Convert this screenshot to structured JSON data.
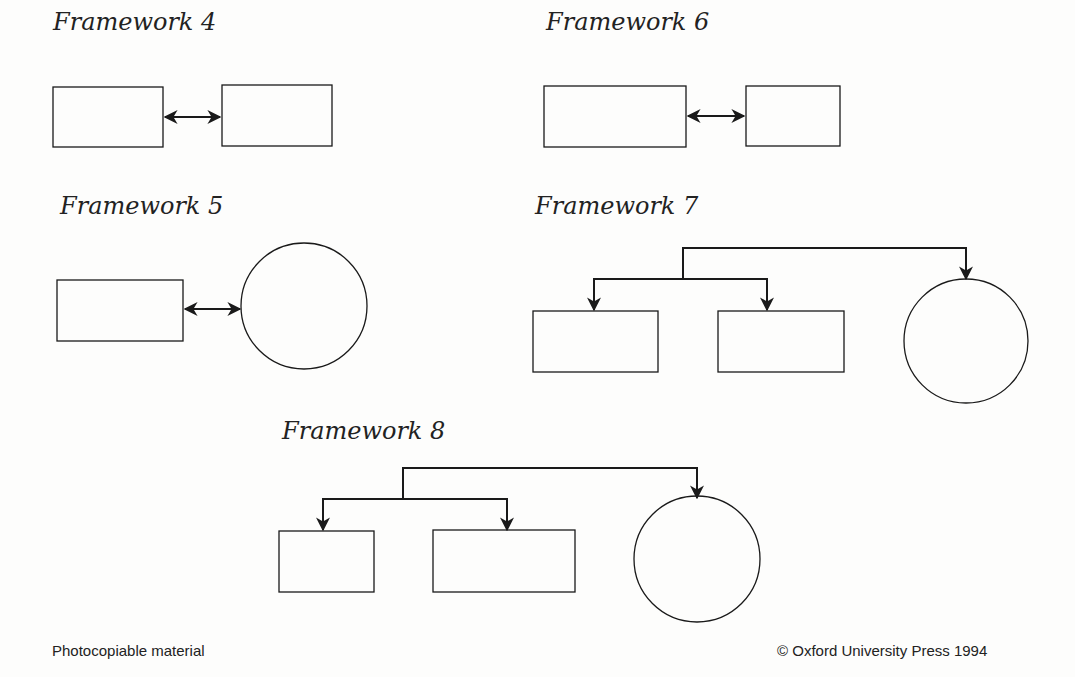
{
  "frameworks": [
    {
      "title": "Framework 4",
      "pos": [
        53,
        8
      ],
      "boxes": [
        [
          53,
          87,
          110,
          60
        ],
        [
          222,
          85,
          110,
          61
        ]
      ],
      "circles": [],
      "links": [
        {
          "type": "double",
          "x1": 165,
          "x2": 220,
          "y": 117
        }
      ]
    },
    {
      "title": "Framework 6",
      "pos": [
        546,
        8
      ],
      "boxes": [
        [
          544,
          86,
          142,
          61
        ],
        [
          746,
          86,
          94,
          60
        ]
      ],
      "circles": [],
      "links": [
        {
          "type": "double",
          "x1": 688,
          "x2": 744,
          "y": 116
        }
      ]
    },
    {
      "title": "Framework 5",
      "pos": [
        60,
        192
      ],
      "boxes": [
        [
          57,
          280,
          126,
          61
        ]
      ],
      "circles": [
        [
          304,
          306,
          63
        ]
      ],
      "links": [
        {
          "type": "double",
          "x1": 185,
          "x2": 240,
          "y": 309
        }
      ]
    },
    {
      "title": "Framework 7",
      "pos": [
        535,
        192
      ],
      "boxes": [
        [
          533,
          311,
          125,
          61
        ],
        [
          718,
          311,
          126,
          61
        ]
      ],
      "circles": [
        [
          966,
          341,
          62
        ]
      ],
      "links": [
        {
          "type": "tree",
          "top": 248,
          "mid": 279,
          "stem": 683,
          "left": 594,
          "midr": 767,
          "right": 966,
          "leftEnd": 310,
          "rightEnd": 279
        }
      ]
    },
    {
      "title": "Framework 8",
      "pos": [
        282,
        417
      ],
      "boxes": [
        [
          279,
          531,
          95,
          61
        ],
        [
          433,
          530,
          142,
          62
        ]
      ],
      "circles": [
        [
          697,
          559,
          63
        ]
      ],
      "links": [
        {
          "type": "tree",
          "top": 468,
          "mid": 499,
          "stem": 403,
          "left": 323,
          "midr": 507,
          "right": 697,
          "leftEnd": 530,
          "rightEnd": 498
        }
      ]
    }
  ],
  "footer": {
    "left": "Photocopiable material",
    "right": "© Oxford University Press 1994"
  }
}
